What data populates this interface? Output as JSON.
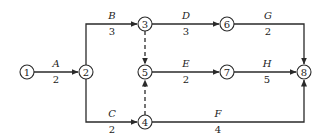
{
  "diagram": {
    "type": "activity-on-arrow network",
    "nodes": [
      {
        "id": "1",
        "label": "1",
        "x": 27,
        "y": 72
      },
      {
        "id": "2",
        "label": "2",
        "x": 86,
        "y": 72
      },
      {
        "id": "3",
        "label": "3",
        "x": 145,
        "y": 24
      },
      {
        "id": "4",
        "label": "4",
        "x": 145,
        "y": 122
      },
      {
        "id": "5",
        "label": "5",
        "x": 145,
        "y": 72
      },
      {
        "id": "6",
        "label": "6",
        "x": 227,
        "y": 24
      },
      {
        "id": "7",
        "label": "7",
        "x": 227,
        "y": 72
      },
      {
        "id": "8",
        "label": "8",
        "x": 304,
        "y": 72
      }
    ],
    "activities": [
      {
        "name": "A",
        "duration": "2",
        "from": "1",
        "to": "2"
      },
      {
        "name": "B",
        "duration": "3",
        "from": "2",
        "to": "3"
      },
      {
        "name": "C",
        "duration": "2",
        "from": "2",
        "to": "4"
      },
      {
        "name": "D",
        "duration": "3",
        "from": "3",
        "to": "6"
      },
      {
        "name": "E",
        "duration": "2",
        "from": "5",
        "to": "7"
      },
      {
        "name": "F",
        "duration": "4",
        "from": "4",
        "to": "8"
      },
      {
        "name": "G",
        "duration": "2",
        "from": "6",
        "to": "8"
      },
      {
        "name": "H",
        "duration": "5",
        "from": "7",
        "to": "8"
      }
    ],
    "dummies": [
      {
        "from": "3",
        "to": "5",
        "style": "dashed"
      },
      {
        "from": "4",
        "to": "5",
        "style": "dashed"
      }
    ]
  }
}
